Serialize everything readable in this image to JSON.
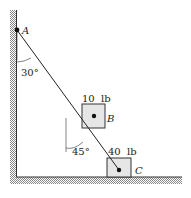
{
  "diagram": {
    "points": {
      "A": "A",
      "B": "B",
      "C": "C"
    },
    "weights": {
      "B": "10  lb",
      "C": "40  lb"
    },
    "angles": {
      "at_A": "30°",
      "at_B": "45°"
    }
  }
}
